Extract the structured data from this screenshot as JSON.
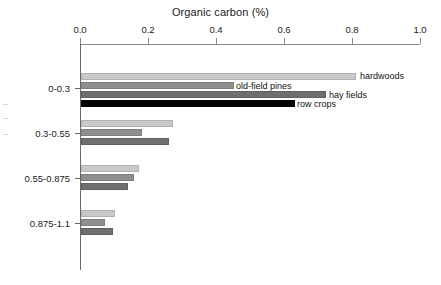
{
  "chart_data": {
    "type": "bar",
    "orientation": "horizontal",
    "title": "Organic carbon (%)",
    "xlabel": "Organic carbon (%)",
    "ylabel": "",
    "xlim": [
      0.0,
      1.0
    ],
    "xticks": [
      "0.0",
      "0.2",
      "0.4",
      "0.6",
      "0.8",
      "1.0"
    ],
    "xtick_values": [
      0.0,
      0.2,
      0.4,
      0.6,
      0.8,
      1.0
    ],
    "grid": false,
    "legend_position": "inline-data-labels",
    "axis_position": "top",
    "categories": [
      "0-0.3",
      "0.3-0.55",
      "0.55-0.875",
      "0.875-1.1"
    ],
    "series": [
      {
        "name": "hardwoods",
        "color": "#c9c9c9",
        "values": [
          0.81,
          0.27,
          0.17,
          0.1
        ]
      },
      {
        "name": "old-field pines",
        "color": "#8f8f8f",
        "values": [
          0.45,
          0.18,
          0.155,
          0.07
        ]
      },
      {
        "name": "hay fields",
        "color": "#6f6f6f",
        "values": [
          0.72,
          0.26,
          0.138,
          0.094
        ]
      },
      {
        "name": "row crops",
        "color": "#000000",
        "values": [
          0.63,
          null,
          null,
          null
        ]
      }
    ],
    "annotations": [
      {
        "text": "hardwoods",
        "series": "hardwoods",
        "category": "0-0.3"
      },
      {
        "text": "old-field pines",
        "series": "old-field pines",
        "category": "0-0.3"
      },
      {
        "text": "hay fields",
        "series": "hay fields",
        "category": "0-0.3"
      },
      {
        "text": "row crops",
        "series": "row crops",
        "category": "0-0.3"
      }
    ]
  },
  "axis": {
    "title": "Organic carbon (%)",
    "xticks": [
      {
        "label": "0.0",
        "x": 80
      },
      {
        "label": "0.2",
        "x": 148
      },
      {
        "label": "0.4",
        "x": 216
      },
      {
        "label": "0.6",
        "x": 284
      },
      {
        "label": "0.8",
        "x": 352
      },
      {
        "label": "1.0",
        "x": 420
      }
    ],
    "yticks": [
      {
        "label": "0-0.3",
        "y": 88
      },
      {
        "label": "0.3-0.55",
        "y": 133
      },
      {
        "label": "0.55-0.875",
        "y": 178
      },
      {
        "label": "0.875-1.1",
        "y": 223
      }
    ]
  },
  "bars": [
    {
      "series": "hardwoods",
      "category": "0-0.3",
      "value": 0.81,
      "y": 73,
      "shade": 0
    },
    {
      "series": "old-field pines",
      "category": "0-0.3",
      "value": 0.45,
      "y": 82,
      "shade": 1
    },
    {
      "series": "hay fields",
      "category": "0-0.3",
      "value": 0.72,
      "y": 91,
      "shade": 2
    },
    {
      "series": "row crops",
      "category": "0-0.3",
      "value": 0.63,
      "y": 100,
      "shade": 3
    },
    {
      "series": "hardwoods",
      "category": "0.3-0.55",
      "value": 0.27,
      "y": 120,
      "shade": 0
    },
    {
      "series": "old-field pines",
      "category": "0.3-0.55",
      "value": 0.18,
      "y": 129,
      "shade": 1
    },
    {
      "series": "hay fields",
      "category": "0.3-0.55",
      "value": 0.26,
      "y": 138,
      "shade": 2
    },
    {
      "series": "hardwoods",
      "category": "0.55-0.875",
      "value": 0.17,
      "y": 165,
      "shade": 0
    },
    {
      "series": "old-field pines",
      "category": "0.55-0.875",
      "value": 0.155,
      "y": 174,
      "shade": 1
    },
    {
      "series": "hay fields",
      "category": "0.55-0.875",
      "value": 0.138,
      "y": 183,
      "shade": 2
    },
    {
      "series": "hardwoods",
      "category": "0.875-1.1",
      "value": 0.1,
      "y": 210,
      "shade": 0
    },
    {
      "series": "old-field pines",
      "category": "0.875-1.1",
      "value": 0.07,
      "y": 219,
      "shade": 1
    },
    {
      "series": "hay fields",
      "category": "0.875-1.1",
      "value": 0.094,
      "y": 228,
      "shade": 2
    }
  ],
  "data_labels": [
    {
      "text": "hardwoods",
      "x": 360,
      "y": 76
    },
    {
      "text": "old-field pines",
      "x": 236,
      "y": 86
    },
    {
      "text": "hay fields",
      "x": 329,
      "y": 95
    },
    {
      "text": "row crops",
      "x": 297,
      "y": 104
    }
  ]
}
